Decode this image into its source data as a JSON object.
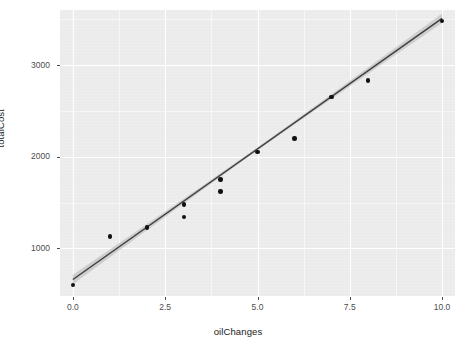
{
  "chart_data": {
    "type": "scatter",
    "title": "",
    "subtitle": "",
    "xlabel": "oilChanges",
    "ylabel": "totalCost",
    "x": [
      0,
      1,
      2,
      3,
      3,
      4,
      4,
      5,
      6,
      7,
      8,
      10
    ],
    "y": [
      600,
      1130,
      1230,
      1480,
      1340,
      1750,
      1620,
      2050,
      2200,
      2650,
      2830,
      3480
    ],
    "points": [
      {
        "x": 0,
        "y": 600
      },
      {
        "x": 1,
        "y": 1130
      },
      {
        "x": 2,
        "y": 1230
      },
      {
        "x": 3,
        "y": 1480
      },
      {
        "x": 3,
        "y": 1340
      },
      {
        "x": 4,
        "y": 1750
      },
      {
        "x": 4,
        "y": 1620
      },
      {
        "x": 5,
        "y": 2050
      },
      {
        "x": 6,
        "y": 2200
      },
      {
        "x": 7,
        "y": 2650
      },
      {
        "x": 8,
        "y": 2830
      },
      {
        "x": 10,
        "y": 3480
      }
    ],
    "series": [
      {
        "name": "observations",
        "type": "scatter",
        "values": [
          600,
          1130,
          1230,
          1480,
          1340,
          1750,
          1620,
          2050,
          2200,
          2650,
          2830,
          3480
        ]
      },
      {
        "name": "linear fit",
        "type": "line",
        "intercept": 660,
        "slope": 285,
        "x_start": 0,
        "x_end": 10,
        "y_start": 660,
        "y_end": 3510,
        "confidence_band": true
      }
    ],
    "xlim": [
      -0.35,
      10.35
    ],
    "ylim": [
      480,
      3600
    ],
    "xticks": [
      0.0,
      2.5,
      5.0,
      7.5,
      10.0
    ],
    "xtick_labels": [
      "0.0",
      "2.5",
      "5.0",
      "7.5",
      "10.0"
    ],
    "yticks": [
      1000,
      2000,
      3000
    ],
    "ytick_labels": [
      "1000",
      "2000",
      "3000"
    ],
    "x_minor_ticks": [
      1.25,
      3.75,
      6.25,
      8.75
    ],
    "y_minor_ticks": [
      1500,
      2500,
      3500
    ],
    "grid": true,
    "legend": "none",
    "panel_background": "#EBEBEB",
    "grid_color": "#FFFFFF",
    "point_color": "#111111",
    "line_color": "#3C3C3C",
    "band_color": "#BFBFBF",
    "text_color": "#4D4D4D"
  }
}
